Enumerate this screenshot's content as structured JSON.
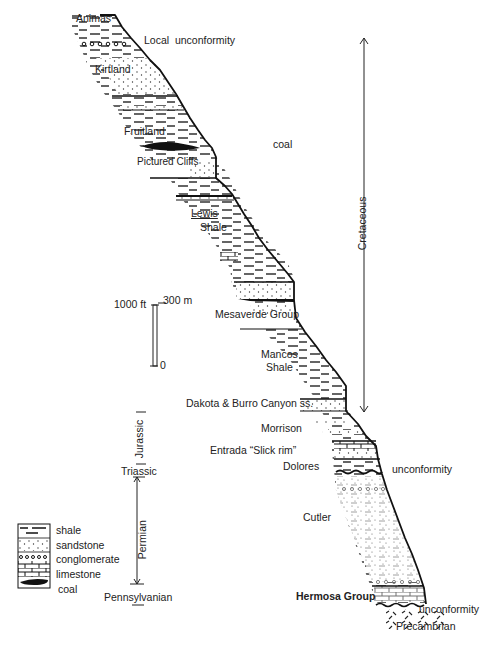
{
  "diagram": {
    "type": "stratigraphic-column",
    "formations": [
      {
        "name": "Animas",
        "label_pos": [
          76,
          17
        ]
      },
      {
        "name": "Kirtland",
        "label_pos": [
          95,
          68
        ]
      },
      {
        "name": "Fruitland",
        "label_pos": [
          124,
          130
        ]
      },
      {
        "name": "Pictured Cliffs",
        "label_pos": [
          137,
          161
        ]
      },
      {
        "name": "Lewis",
        "label_pos": [
          191,
          212
        ]
      },
      {
        "name": "Shale",
        "label_pos": [
          200,
          226
        ]
      },
      {
        "name": "Mesaverde Group",
        "label_pos": [
          215,
          311
        ]
      },
      {
        "name": "Mancos",
        "label_pos": [
          261,
          353
        ]
      },
      {
        "name": "Shale",
        "label_pos": [
          266,
          367
        ]
      },
      {
        "name": "Dakota & Burro Canyon ss.",
        "label_pos": [
          186,
          401
        ]
      },
      {
        "name": "Morrison",
        "label_pos": [
          261,
          426
        ]
      },
      {
        "name": "Entrada “Slick rim”",
        "label_pos": [
          210,
          448
        ]
      },
      {
        "name": "Dolores",
        "label_pos": [
          283,
          464
        ]
      },
      {
        "name": "Cutler",
        "label_pos": [
          303,
          515
        ]
      },
      {
        "name": "Hermosa Group",
        "label_pos": [
          297,
          593
        ]
      },
      {
        "name": "Precambrian",
        "label_pos": [
          396,
          624
        ]
      }
    ],
    "annotations": [
      {
        "text": "Local  unconformity",
        "pos": [
          144,
          37
        ]
      },
      {
        "text": "coal",
        "pos": [
          273,
          142
        ]
      },
      {
        "text": "unconformity",
        "pos": [
          392,
          464
        ]
      },
      {
        "text": "unconformity",
        "pos": [
          418,
          607
        ]
      }
    ],
    "periods": {
      "cretaceous": "Cretaceous",
      "jurassic": "Jurassic",
      "triassic": "Triassic",
      "permian": "Permian",
      "pennsylvanian": "Pennsylvanian"
    },
    "scale_bar": {
      "top_ft": "1000 ft",
      "top_m": "300 m",
      "bottom": "0"
    },
    "legend": [
      {
        "pattern": "shale",
        "label": "shale"
      },
      {
        "pattern": "sandstone",
        "label": "sandstone"
      },
      {
        "pattern": "conglomerate",
        "label": "conglomerate"
      },
      {
        "pattern": "limestone",
        "label": "limestone"
      },
      {
        "pattern": "coal",
        "label": "coal"
      }
    ]
  }
}
